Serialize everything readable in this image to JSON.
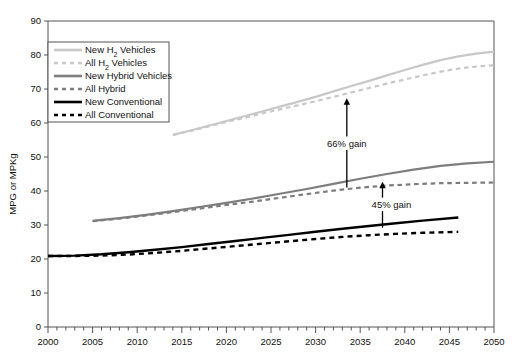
{
  "chart_data": {
    "type": "line",
    "title": "",
    "xlabel": "",
    "ylabel": "MPG or MPKg",
    "xlim": [
      2000,
      2050
    ],
    "ylim": [
      0,
      90
    ],
    "y_ticks": [
      0,
      10,
      20,
      30,
      40,
      50,
      60,
      70,
      80,
      90
    ],
    "x_ticks": [
      2000,
      2005,
      2010,
      2015,
      2020,
      2025,
      2030,
      2035,
      2040,
      2045,
      2050
    ],
    "x_minor_tick_step": 1,
    "grid": false,
    "legend_position": "upper-left-inside",
    "series": [
      {
        "name": "New H2 Vehicles",
        "label_html": "New H<sub>2</sub> Vehicles",
        "color": "#c8c8c8",
        "style": "solid",
        "width": 2.2,
        "x": [
          2014,
          2016,
          2018,
          2020,
          2022,
          2024,
          2026,
          2028,
          2030,
          2032,
          2034,
          2036,
          2038,
          2040,
          2042,
          2044,
          2046,
          2048,
          2050
        ],
        "values": [
          56.5,
          57.8,
          59.2,
          60.6,
          62.0,
          63.4,
          64.8,
          66.2,
          67.7,
          69.3,
          70.9,
          72.4,
          74.0,
          75.6,
          77.1,
          78.5,
          79.6,
          80.4,
          81.0
        ]
      },
      {
        "name": "All H2 Vehicles",
        "label_html": "All H<sub>2</sub> Vehicles",
        "color": "#c8c8c8",
        "style": "dashed",
        "width": 2.2,
        "x": [
          2014,
          2016,
          2018,
          2020,
          2022,
          2024,
          2026,
          2028,
          2030,
          2032,
          2034,
          2036,
          2038,
          2040,
          2042,
          2044,
          2046,
          2048,
          2050
        ],
        "values": [
          56.5,
          57.7,
          59.0,
          60.3,
          61.5,
          62.8,
          64.0,
          65.2,
          66.4,
          67.7,
          69.0,
          70.3,
          71.6,
          72.8,
          74.0,
          75.1,
          76.0,
          76.6,
          77.0
        ]
      },
      {
        "name": "New Hybrid Vehicles",
        "label_html": "New Hybrid Vehicles",
        "color": "#7d7d7d",
        "style": "solid",
        "width": 2.2,
        "x": [
          2005,
          2008,
          2011,
          2014,
          2017,
          2020,
          2023,
          2026,
          2029,
          2032,
          2035,
          2038,
          2041,
          2044,
          2047,
          2050
        ],
        "values": [
          31.2,
          32.0,
          33.0,
          34.1,
          35.3,
          36.5,
          37.8,
          39.2,
          40.6,
          42.1,
          43.6,
          45.0,
          46.3,
          47.4,
          48.1,
          48.6
        ]
      },
      {
        "name": "All Hybrid",
        "label_html": "All Hybrid",
        "color": "#7d7d7d",
        "style": "dashed",
        "width": 2.2,
        "x": [
          2005,
          2008,
          2011,
          2014,
          2017,
          2020,
          2023,
          2026,
          2029,
          2032,
          2035,
          2038,
          2041,
          2044,
          2047,
          2050
        ],
        "values": [
          31.1,
          31.9,
          32.8,
          33.8,
          34.8,
          35.9,
          36.9,
          38.0,
          39.1,
          40.1,
          41.0,
          41.6,
          42.0,
          42.3,
          42.4,
          42.5
        ]
      },
      {
        "name": "New Conventional",
        "label_html": "New Conventional",
        "color": "#000000",
        "style": "solid",
        "width": 2.4,
        "x": [
          2000,
          2003,
          2006,
          2009,
          2012,
          2015,
          2018,
          2021,
          2024,
          2027,
          2030,
          2033,
          2036,
          2039,
          2042,
          2046
        ],
        "values": [
          20.9,
          21.0,
          21.4,
          22.0,
          22.7,
          23.5,
          24.4,
          25.3,
          26.2,
          27.1,
          28.0,
          28.9,
          29.7,
          30.5,
          31.3,
          32.2
        ]
      },
      {
        "name": "All Conventional",
        "label_html": "All Conventional",
        "color": "#000000",
        "style": "dashed",
        "width": 2.4,
        "x": [
          2000,
          2003,
          2006,
          2009,
          2012,
          2015,
          2018,
          2021,
          2024,
          2027,
          2030,
          2033,
          2036,
          2039,
          2042,
          2046
        ],
        "values": [
          20.9,
          20.9,
          21.0,
          21.3,
          21.8,
          22.4,
          23.1,
          23.8,
          24.5,
          25.2,
          25.9,
          26.5,
          27.0,
          27.4,
          27.7,
          28.0
        ]
      }
    ],
    "annotations": [
      {
        "name": "h2-gain",
        "text": "66% gain",
        "x": 2033.5,
        "y_from": 41.0,
        "y_to": 67.0,
        "label_x": 2033.5,
        "label_y": 54.0,
        "arrow": "up"
      },
      {
        "name": "hybrid-gain",
        "text": "45% gain",
        "x": 2037.5,
        "y_from": 29.2,
        "y_to": 42.4,
        "label_x": 2038.5,
        "label_y": 36.0,
        "arrow": "up"
      }
    ]
  },
  "axes": {
    "y_label": "MPG or MPKg",
    "y_tick_labels": [
      "0",
      "10",
      "20",
      "30",
      "40",
      "50",
      "60",
      "70",
      "80",
      "90"
    ],
    "x_tick_labels": [
      "2000",
      "2005",
      "2010",
      "2015",
      "2020",
      "2025",
      "2030",
      "2035",
      "2040",
      "2045",
      "2050"
    ]
  },
  "legend": {
    "items": [
      {
        "label": "New H",
        "sub": "2",
        "label_tail": " Vehicles",
        "color": "#c8c8c8",
        "style": "solid"
      },
      {
        "label": "All H",
        "sub": "2",
        "label_tail": " Vehicles",
        "color": "#c8c8c8",
        "style": "dashed"
      },
      {
        "label": "New Hybrid Vehicles",
        "sub": "",
        "label_tail": "",
        "color": "#7d7d7d",
        "style": "solid"
      },
      {
        "label": "All Hybrid",
        "sub": "",
        "label_tail": "",
        "color": "#7d7d7d",
        "style": "dashed"
      },
      {
        "label": "New Conventional",
        "sub": "",
        "label_tail": "",
        "color": "#000000",
        "style": "solid"
      },
      {
        "label": "All Conventional",
        "sub": "",
        "label_tail": "",
        "color": "#000000",
        "style": "dashed"
      }
    ]
  },
  "colors": {
    "h2": "#c8c8c8",
    "hybrid": "#7d7d7d",
    "conventional": "#000000",
    "axis": "#555555",
    "background": "#ffffff"
  }
}
